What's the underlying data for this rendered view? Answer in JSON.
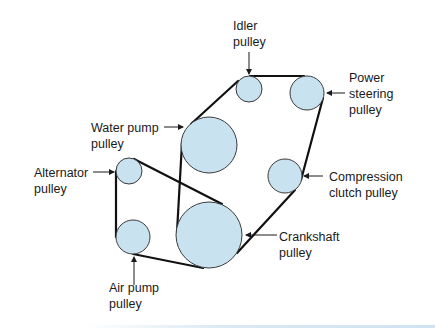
{
  "diagram": {
    "type": "serpentine-belt-pulley-layout",
    "colors": {
      "pulley_fill": "#c9e2ef",
      "pulley_stroke": "#3a3a3a",
      "belt": "#111111",
      "text": "#1a1a1a"
    },
    "pulleys": [
      {
        "id": "idler",
        "label_lines": [
          "Idler",
          "pulley"
        ],
        "cx": 249,
        "cy": 89,
        "r": 13
      },
      {
        "id": "power-steering",
        "label_lines": [
          "Power",
          "steering",
          "pulley"
        ],
        "cx": 307,
        "cy": 93,
        "r": 17
      },
      {
        "id": "water-pump",
        "label_lines": [
          "Water pump",
          "pulley"
        ],
        "cx": 209,
        "cy": 145,
        "r": 28
      },
      {
        "id": "alternator",
        "label_lines": [
          "Alternator",
          "pulley"
        ],
        "cx": 129,
        "cy": 171,
        "r": 13
      },
      {
        "id": "compression-clutch",
        "label_lines": [
          "Compression",
          "clutch pulley"
        ],
        "cx": 285,
        "cy": 176,
        "r": 17
      },
      {
        "id": "air-pump",
        "label_lines": [
          "Air pump",
          "pulley"
        ],
        "cx": 133,
        "cy": 237,
        "r": 17
      },
      {
        "id": "crankshaft",
        "label_lines": [
          "Crankshaft",
          "pulley"
        ],
        "cx": 209,
        "cy": 235,
        "r": 33
      }
    ]
  },
  "labels": {
    "idler": {
      "line1": "Idler",
      "line2": "pulley"
    },
    "power_steering": {
      "line1": "Power",
      "line2": "steering",
      "line3": "pulley"
    },
    "water_pump": {
      "line1": "Water pump",
      "line2": "pulley"
    },
    "alternator": {
      "line1": "Alternator",
      "line2": "pulley"
    },
    "compression_clutch": {
      "line1": "Compression",
      "line2": "clutch pulley"
    },
    "crankshaft": {
      "line1": "Crankshaft",
      "line2": "pulley"
    },
    "air_pump": {
      "line1": "Air pump",
      "line2": "pulley"
    }
  }
}
